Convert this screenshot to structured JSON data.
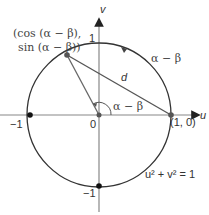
{
  "diagram": {
    "type": "unit-circle",
    "equation": "u² + v² = 1",
    "axes": {
      "horizontal_label": "u",
      "vertical_label": "v"
    },
    "ticks": {
      "v_pos": "1",
      "v_neg": "−1",
      "u_neg": "−1",
      "origin": "0"
    },
    "points": {
      "p_label_line1": "(cos (α − β),",
      "p_label_line2": "sin (α − β))",
      "q_label": "(1, 0)"
    },
    "chord_label": "d",
    "arc_label": "α − β",
    "angle_label": "α − β",
    "colors": {
      "circle": "#333333",
      "axes": "#777777",
      "lines": "#666666",
      "points": "#111111"
    }
  }
}
